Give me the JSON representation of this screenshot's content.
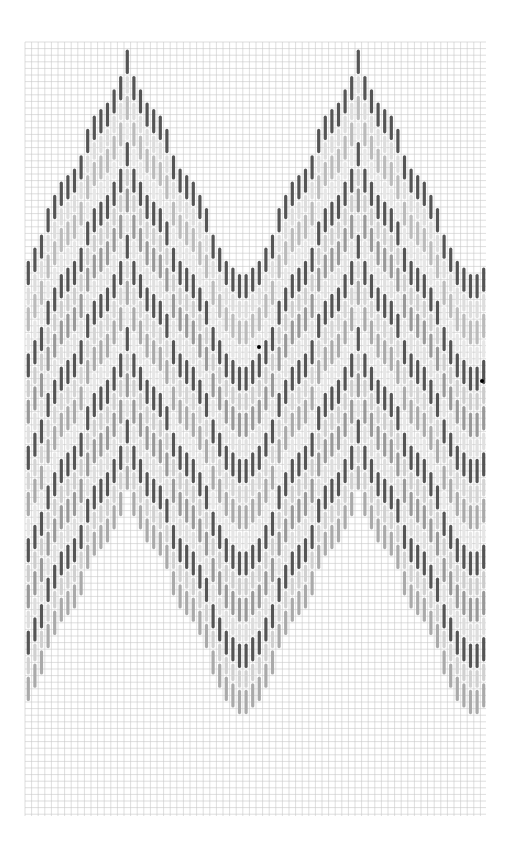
{
  "chart_data": {
    "type": "bargello-stitch-chart",
    "grid": {
      "left": 25,
      "top": 42,
      "right": 486,
      "bottom": 816,
      "cell": 6.6,
      "columns": 70,
      "rows": 117,
      "line_color": "#c8c8c8",
      "major_every": 0
    },
    "repeat": {
      "period_columns": 35,
      "first_peak_column": 15,
      "peak_top_row": 1,
      "valley_row_offset": 44
    },
    "outline_profile_steps": [
      4,
      2,
      2,
      1,
      1,
      2,
      4,
      2,
      1,
      1,
      2,
      2,
      4,
      2,
      2,
      1,
      1,
      2
    ],
    "bands": [
      {
        "offset": 0,
        "length": 4,
        "color": "#555555"
      },
      {
        "offset": 4,
        "length": 3,
        "color": "#dddddd"
      },
      {
        "offset": 7,
        "length": 4,
        "color": "#bbbbbb"
      },
      {
        "offset": 11,
        "length": 3,
        "color": "#e6e6e6"
      },
      {
        "offset": 14,
        "length": 4,
        "color": "#555555"
      },
      {
        "offset": 18,
        "length": 3,
        "color": "#cccccc"
      },
      {
        "offset": 21,
        "length": 4,
        "color": "#999999"
      },
      {
        "offset": 25,
        "length": 3,
        "color": "#e0e0e0"
      },
      {
        "offset": 28,
        "length": 4,
        "color": "#555555"
      },
      {
        "offset": 32,
        "length": 3,
        "color": "#d4d4d4"
      },
      {
        "offset": 35,
        "length": 4,
        "color": "#aaaaaa"
      },
      {
        "offset": 39,
        "length": 3,
        "color": "#e6e6e6"
      },
      {
        "offset": 42,
        "length": 4,
        "color": "#555555"
      },
      {
        "offset": 46,
        "length": 3,
        "color": "#cccccc"
      },
      {
        "offset": 49,
        "length": 4,
        "color": "#999999"
      },
      {
        "offset": 53,
        "length": 3,
        "color": "#dddddd"
      },
      {
        "offset": 56,
        "length": 4,
        "color": "#555555"
      },
      {
        "offset": 60,
        "length": 3,
        "color": "#d0d0d0"
      },
      {
        "offset": 63,
        "length": 4,
        "color": "#aaaaaa"
      }
    ],
    "markers": [
      {
        "x": 259,
        "y": 347,
        "r": 2,
        "color": "#000000"
      },
      {
        "x": 482,
        "y": 381,
        "r": 2,
        "color": "#000000"
      }
    ]
  }
}
